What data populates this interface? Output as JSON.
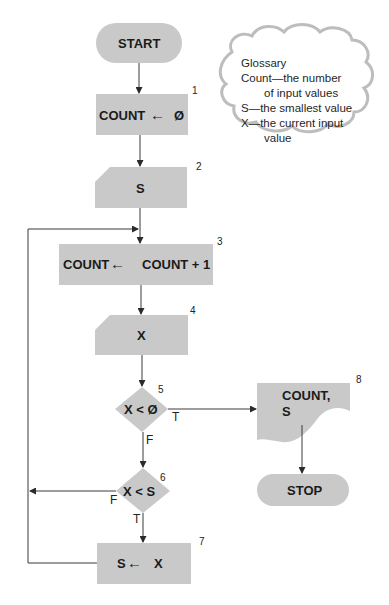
{
  "figure": {
    "type": "flowchart"
  },
  "colors": {
    "shape_fill": "#c9c9c9",
    "line": "#3a3a3a",
    "cloud_fill": "#ffffff",
    "cloud_border": "#bdbdbd",
    "background": "#ffffff"
  },
  "glossary": {
    "title": "Glossary",
    "lines": [
      "Count—the number",
      "of input values",
      "S—the smallest value",
      "X—the current input",
      "value"
    ]
  },
  "nodes": {
    "start": {
      "label": "START",
      "shape": "terminal"
    },
    "n1": {
      "number": "1",
      "shape": "process",
      "target": "COUNT",
      "arrow": "←",
      "source": "Ø"
    },
    "n2": {
      "number": "2",
      "shape": "manual-input",
      "label": "S"
    },
    "n3": {
      "number": "3",
      "shape": "process",
      "target": "COUNT",
      "arrow": "←",
      "source": "COUNT + 1"
    },
    "n4": {
      "number": "4",
      "shape": "manual-input",
      "label": "X"
    },
    "n5": {
      "number": "5",
      "shape": "decision",
      "label": "X < Ø",
      "true_label": "T",
      "false_label": "F"
    },
    "n6": {
      "number": "6",
      "shape": "decision",
      "label": "X < S",
      "true_label": "T",
      "false_label": "F"
    },
    "n7": {
      "number": "7",
      "shape": "process",
      "target": "S",
      "arrow": "←",
      "source": "X"
    },
    "n8": {
      "number": "8",
      "shape": "document",
      "line1": "COUNT,",
      "line2": "S"
    },
    "stop": {
      "label": "STOP",
      "shape": "terminal"
    }
  },
  "edges": [
    {
      "from": "start",
      "to": "n1"
    },
    {
      "from": "n1",
      "to": "n2"
    },
    {
      "from": "n2",
      "to": "n3"
    },
    {
      "from": "n3",
      "to": "n4"
    },
    {
      "from": "n4",
      "to": "n5"
    },
    {
      "from": "n5",
      "to": "n8",
      "label": "T"
    },
    {
      "from": "n5",
      "to": "n6",
      "label": "F"
    },
    {
      "from": "n6",
      "to": "n3",
      "label": "F"
    },
    {
      "from": "n6",
      "to": "n7",
      "label": "T"
    },
    {
      "from": "n7",
      "to": "n3"
    },
    {
      "from": "n8",
      "to": "stop"
    }
  ]
}
